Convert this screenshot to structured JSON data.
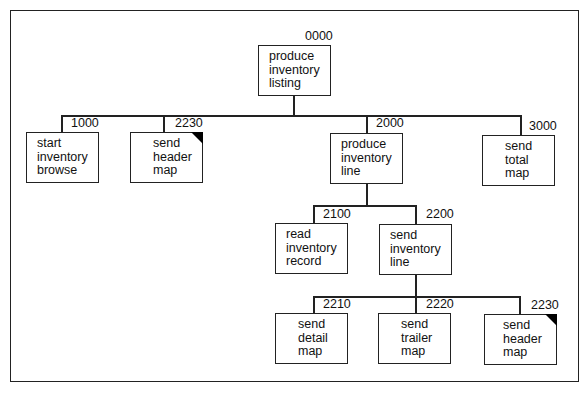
{
  "diagram": {
    "type": "structure-chart",
    "nodes": [
      {
        "id": "0000",
        "lines": [
          "produce",
          "inventory",
          "listing"
        ],
        "shared": false
      },
      {
        "id": "1000",
        "lines": [
          "start",
          "inventory",
          "browse"
        ],
        "shared": false
      },
      {
        "id": "2230",
        "lines": [
          "send",
          "header",
          "map"
        ],
        "shared": true
      },
      {
        "id": "2000",
        "lines": [
          "produce",
          "inventory",
          "line"
        ],
        "shared": false
      },
      {
        "id": "3000",
        "lines": [
          "send",
          "total",
          "map"
        ],
        "shared": false
      },
      {
        "id": "2100",
        "lines": [
          "read",
          "inventory",
          "record"
        ],
        "shared": false
      },
      {
        "id": "2200",
        "lines": [
          "send",
          "inventory",
          "line"
        ],
        "shared": false
      },
      {
        "id": "2210",
        "lines": [
          "send",
          "detail",
          "map"
        ],
        "shared": false
      },
      {
        "id": "2220",
        "lines": [
          "send",
          "trailer",
          "map"
        ],
        "shared": false
      },
      {
        "id": "2230",
        "lines": [
          "send",
          "header",
          "map"
        ],
        "shared": true
      }
    ],
    "edges": [
      [
        "0000",
        "1000"
      ],
      [
        "0000",
        "2230"
      ],
      [
        "0000",
        "2000"
      ],
      [
        "0000",
        "3000"
      ],
      [
        "2000",
        "2100"
      ],
      [
        "2000",
        "2200"
      ],
      [
        "2200",
        "2210"
      ],
      [
        "2200",
        "2220"
      ],
      [
        "2200",
        "2230"
      ]
    ]
  }
}
